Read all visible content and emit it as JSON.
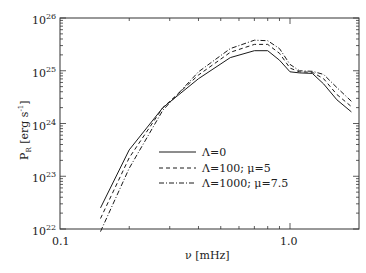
{
  "chart_data": {
    "type": "line",
    "title": "",
    "xlabel": "ν [mHz]",
    "ylabel": "P_R [erg s^-1]",
    "xscale": "log",
    "yscale": "log",
    "xlim": [
      0.1,
      2.0
    ],
    "ylim": [
      1e+22,
      1e+26
    ],
    "x_ticks": [
      {
        "value": 0.1,
        "label": "0.1"
      },
      {
        "value": 1.0,
        "label": "1.0"
      }
    ],
    "y_ticks": [
      {
        "exp": 22,
        "label_base": "10",
        "label_exp": "22"
      },
      {
        "exp": 23,
        "label_base": "10",
        "label_exp": "23"
      },
      {
        "exp": 24,
        "label_base": "10",
        "label_exp": "24"
      },
      {
        "exp": 25,
        "label_base": "10",
        "label_exp": "25"
      },
      {
        "exp": 26,
        "label_base": "10",
        "label_exp": "26"
      }
    ],
    "grid": false,
    "legend_position": "lower center (inside plot)",
    "series": [
      {
        "name": "Λ=0",
        "style": "solid",
        "x": [
          0.15,
          0.2,
          0.28,
          0.4,
          0.55,
          0.7,
          0.8,
          0.9,
          1.0,
          1.1,
          1.25,
          1.4,
          1.6,
          1.85
        ],
        "log10y": [
          22.4,
          23.5,
          24.3,
          24.85,
          25.25,
          25.38,
          25.38,
          25.2,
          24.98,
          24.96,
          24.95,
          24.75,
          24.45,
          24.22
        ]
      },
      {
        "name": "Λ=100; μ=5",
        "style": "dashed",
        "x": [
          0.15,
          0.2,
          0.28,
          0.4,
          0.55,
          0.7,
          0.8,
          0.9,
          1.0,
          1.1,
          1.25,
          1.4,
          1.6,
          1.85
        ],
        "log10y": [
          22.2,
          23.35,
          24.3,
          24.92,
          25.35,
          25.5,
          25.5,
          25.33,
          25.05,
          24.98,
          24.97,
          24.85,
          24.55,
          24.32
        ]
      },
      {
        "name": "Λ=1000; μ=7.5",
        "style": "dash-dot",
        "x": [
          0.15,
          0.2,
          0.28,
          0.4,
          0.55,
          0.7,
          0.8,
          0.9,
          1.0,
          1.1,
          1.25,
          1.4,
          1.6,
          1.85
        ],
        "log10y": [
          21.95,
          23.15,
          24.25,
          24.98,
          25.42,
          25.58,
          25.57,
          25.42,
          25.12,
          25.0,
          24.99,
          24.93,
          24.68,
          24.42
        ]
      }
    ]
  },
  "legend": {
    "items": [
      {
        "label": "Λ=0",
        "style": "solid"
      },
      {
        "label": "Λ=100;  μ=5",
        "style": "dashed"
      },
      {
        "label": "Λ=1000;  μ=7.5",
        "style": "dash-dot"
      }
    ]
  },
  "axes": {
    "xlabel": "ν [mHz]",
    "ylabel_main": "P",
    "ylabel_sub": "R",
    "ylabel_unit": " [erg s",
    "ylabel_unit_exp": "-1",
    "ylabel_close": "]"
  },
  "colors": {
    "line": "#1a1a1a",
    "axis": "#333333",
    "background": "#ffffff"
  }
}
